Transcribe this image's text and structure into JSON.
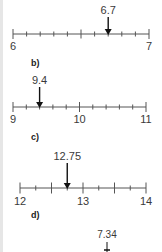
{
  "colors": {
    "line": "#555555",
    "text": "#3a3a3a",
    "arrow": "#111111"
  },
  "parts": [
    {
      "label": "",
      "min": 6,
      "max": 7,
      "step": 0.1,
      "major_every": 5,
      "min_label": "6",
      "mid_label": "",
      "max_label": "7",
      "marker_value": 6.7,
      "marker_label": "6.7"
    },
    {
      "label": "b)",
      "min": 9,
      "max": 11,
      "step": 0.2,
      "major_every": 5,
      "min_label": "9",
      "mid_label": "10",
      "max_label": "11",
      "marker_value": 9.4,
      "marker_label": "9.4"
    },
    {
      "label": "c)",
      "min": 12,
      "max": 14,
      "step": 0.25,
      "major_every": 2,
      "min_label": "12",
      "mid_label": "13",
      "max_label": "14",
      "marker_value": 12.75,
      "marker_label": "12.75"
    },
    {
      "label": "d)",
      "marker_value": 7.34,
      "marker_label": "7.34"
    }
  ]
}
